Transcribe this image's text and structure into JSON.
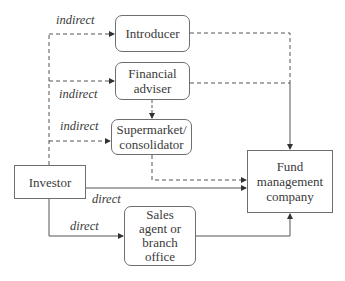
{
  "diagram": {
    "nodes": {
      "investor": "Investor",
      "introducer": "Introducer",
      "financial_adviser": "Financial\nadviser",
      "supermarket": "Supermarket/\nconsolidator",
      "sales_agent": "Sales\nagent or\nbranch\noffice",
      "fund_company": "Fund\nmanagement\ncompany"
    },
    "edge_labels": {
      "to_introducer": "indirect",
      "to_financial_adviser": "indirect",
      "to_supermarket": "indirect",
      "direct_to_fund": "direct",
      "to_sales_agent": "direct"
    },
    "edges": [
      {
        "from": "investor",
        "to": "introducer",
        "style": "dashed",
        "label": "indirect"
      },
      {
        "from": "investor",
        "to": "financial_adviser",
        "style": "dashed",
        "label": "indirect"
      },
      {
        "from": "investor",
        "to": "supermarket",
        "style": "dashed",
        "label": "indirect"
      },
      {
        "from": "financial_adviser",
        "to": "supermarket",
        "style": "dashed"
      },
      {
        "from": "introducer",
        "to": "fund_company",
        "style": "dashed"
      },
      {
        "from": "financial_adviser",
        "to": "fund_company",
        "style": "dashed"
      },
      {
        "from": "supermarket",
        "to": "fund_company",
        "style": "dashed"
      },
      {
        "from": "investor",
        "to": "fund_company",
        "style": "solid",
        "label": "direct"
      },
      {
        "from": "investor",
        "to": "sales_agent",
        "style": "solid",
        "label": "direct"
      },
      {
        "from": "sales_agent",
        "to": "fund_company",
        "style": "solid"
      }
    ]
  }
}
